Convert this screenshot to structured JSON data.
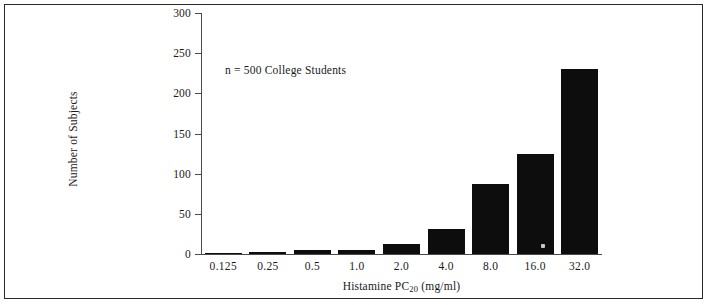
{
  "figure": {
    "annotation": "n = 500 College Students"
  },
  "chart_data": {
    "type": "bar",
    "title": "",
    "xlabel": "Histamine PC20 (mg/ml)",
    "xlabel_main": "Histamine PC",
    "xlabel_sub": "20",
    "xlabel_unit": " (mg/ml)",
    "ylabel": "Number of Subjects",
    "categories": [
      "0.125",
      "0.25",
      "0.5",
      "1.0",
      "2.0",
      "4.0",
      "8.0",
      "16.0",
      "32.0"
    ],
    "values": [
      1,
      2,
      5,
      5,
      13,
      31,
      87,
      125,
      230
    ],
    "ylim": [
      0,
      300
    ],
    "yticks": [
      0,
      50,
      100,
      150,
      200,
      250,
      300
    ],
    "ytick_labels": [
      "0",
      "50",
      "100",
      "150",
      "200",
      "250",
      "300"
    ],
    "grid": false,
    "legend": "none",
    "bar_color": "#0d0d0d",
    "annotations": [
      "n = 500 College Students"
    ]
  }
}
